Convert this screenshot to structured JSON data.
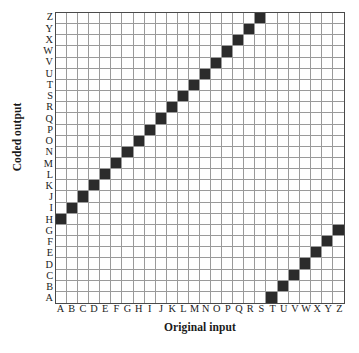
{
  "chart_data": {
    "type": "heatmap",
    "title": "",
    "xlabel": "Original input",
    "ylabel": "Coded output",
    "categories": [
      "A",
      "B",
      "C",
      "D",
      "E",
      "F",
      "G",
      "H",
      "I",
      "J",
      "K",
      "L",
      "M",
      "N",
      "O",
      "P",
      "Q",
      "R",
      "S",
      "T",
      "U",
      "V",
      "W",
      "X",
      "Y",
      "Z"
    ],
    "x": [
      "A",
      "B",
      "C",
      "D",
      "E",
      "F",
      "G",
      "H",
      "I",
      "J",
      "K",
      "L",
      "M",
      "N",
      "O",
      "P",
      "Q",
      "R",
      "S",
      "T",
      "U",
      "V",
      "W",
      "X",
      "Y",
      "Z"
    ],
    "y": [
      "A",
      "B",
      "C",
      "D",
      "E",
      "F",
      "G",
      "H",
      "I",
      "J",
      "K",
      "L",
      "M",
      "N",
      "O",
      "P",
      "Q",
      "R",
      "S",
      "T",
      "U",
      "V",
      "W",
      "X",
      "Y",
      "Z"
    ],
    "y_axis_order": "reversed",
    "xlim": [
      "A",
      "Z"
    ],
    "ylim": [
      "A",
      "Z"
    ],
    "grid": true,
    "legend": "none",
    "cipher": "Caesar shift +7",
    "filled_color": "#2b2b2b",
    "empty_color": "#ffffff",
    "gridline_color": "#9a9a9a",
    "border_color": "#4a4a4a",
    "mapping": [
      {
        "input": "A",
        "output": "H"
      },
      {
        "input": "B",
        "output": "I"
      },
      {
        "input": "C",
        "output": "J"
      },
      {
        "input": "D",
        "output": "K"
      },
      {
        "input": "E",
        "output": "L"
      },
      {
        "input": "F",
        "output": "M"
      },
      {
        "input": "G",
        "output": "N"
      },
      {
        "input": "H",
        "output": "O"
      },
      {
        "input": "I",
        "output": "P"
      },
      {
        "input": "J",
        "output": "Q"
      },
      {
        "input": "K",
        "output": "R"
      },
      {
        "input": "L",
        "output": "S"
      },
      {
        "input": "M",
        "output": "T"
      },
      {
        "input": "N",
        "output": "U"
      },
      {
        "input": "O",
        "output": "V"
      },
      {
        "input": "P",
        "output": "W"
      },
      {
        "input": "Q",
        "output": "X"
      },
      {
        "input": "R",
        "output": "Y"
      },
      {
        "input": "S",
        "output": "Z"
      },
      {
        "input": "T",
        "output": "A"
      },
      {
        "input": "U",
        "output": "B"
      },
      {
        "input": "V",
        "output": "C"
      },
      {
        "input": "W",
        "output": "D"
      },
      {
        "input": "X",
        "output": "E"
      },
      {
        "input": "Y",
        "output": "F"
      },
      {
        "input": "Z",
        "output": "G"
      }
    ]
  }
}
